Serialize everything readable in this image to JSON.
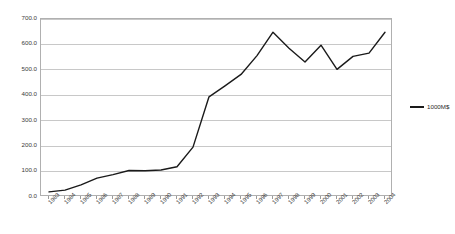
{
  "chart_data": {
    "type": "line",
    "title": "",
    "subtitle": "",
    "xlabel": "",
    "ylabel": "",
    "categories": [
      "1983",
      "1984",
      "1985",
      "1986",
      "1987",
      "1988",
      "1989",
      "1990",
      "1991",
      "1992",
      "1993",
      "1994",
      "1995",
      "1996",
      "1997",
      "1998",
      "1999",
      "2000",
      "2001",
      "2002",
      "2003",
      "2004"
    ],
    "series": [
      {
        "name": "1000M$",
        "values": [
          20.0,
          27.0,
          48.0,
          74.0,
          88.0,
          104.0,
          103.0,
          106.0,
          119.0,
          196.0,
          394.0,
          437.0,
          482.0,
          556.0,
          648.0,
          585.0,
          531.0,
          597.0,
          502.0,
          553.0,
          566.0,
          648.0
        ]
      }
    ],
    "ylim": [
      0,
      700
    ],
    "yticks": [
      0,
      100,
      200,
      300,
      400,
      500,
      600,
      700
    ],
    "ytick_labels": [
      "0.0",
      "100.0",
      "200.0",
      "300.0",
      "400.0",
      "500.0",
      "600.0",
      "700.0"
    ],
    "grid": true,
    "legend": {
      "position": "right",
      "entries": [
        {
          "label": "1000M$",
          "color": "#1a1a1a"
        }
      ]
    },
    "colors": {
      "line": "#1a1a1a",
      "grid": "#c8c8c8",
      "frame": "#b0b0b0",
      "text": "#3a3a3a",
      "background": "#ffffff"
    }
  }
}
